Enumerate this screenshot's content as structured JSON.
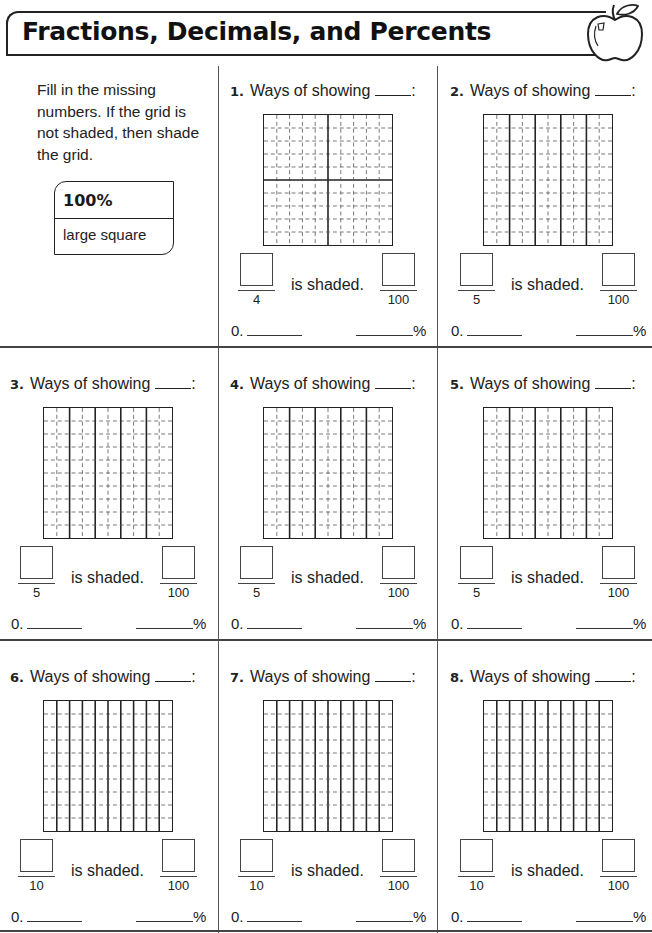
{
  "header": {
    "title": "Fractions, Decimals, and Percents",
    "icon": "apple-icon"
  },
  "intro": {
    "instructions": "Fill in the missing numbers. If the grid is not shaded, then shade the grid.",
    "key": {
      "value": "100%",
      "label": "large square"
    }
  },
  "common": {
    "ways_label": "Ways of showing",
    "colon": ":",
    "is_shaded": "is shaded.",
    "decimal_prefix": "0.",
    "percent_suffix": "%",
    "hundred": "100"
  },
  "problems": [
    {
      "number": "1.",
      "grid_type": "quarters",
      "denominator": "4"
    },
    {
      "number": "2.",
      "grid_type": "fifths",
      "denominator": "5"
    },
    {
      "number": "3.",
      "grid_type": "fifths",
      "denominator": "5"
    },
    {
      "number": "4.",
      "grid_type": "fifths",
      "denominator": "5"
    },
    {
      "number": "5.",
      "grid_type": "fifths",
      "denominator": "5"
    },
    {
      "number": "6.",
      "grid_type": "tenths",
      "denominator": "10"
    },
    {
      "number": "7.",
      "grid_type": "tenths",
      "denominator": "10"
    },
    {
      "number": "8.",
      "grid_type": "tenths",
      "denominator": "10"
    }
  ]
}
